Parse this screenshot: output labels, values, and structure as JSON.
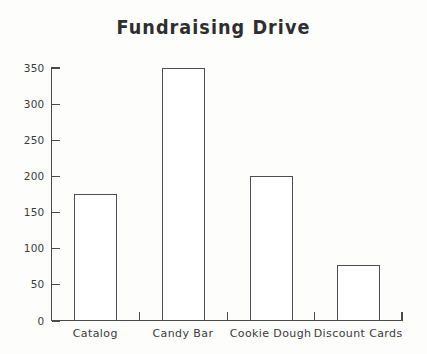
{
  "chart_data": {
    "type": "bar",
    "title": "Fundraising Drive",
    "xlabel": "",
    "ylabel": "",
    "categories": [
      "Catalog",
      "Candy Bar",
      "Cookie Dough",
      "Discount Cards"
    ],
    "values": [
      175,
      350,
      200,
      77
    ],
    "ylim": [
      0,
      350
    ],
    "yticks": [
      0,
      50,
      100,
      150,
      200,
      250,
      300,
      350
    ],
    "ytick_labels": [
      "0",
      "50",
      "100",
      "150",
      "200",
      "250",
      "300",
      "350"
    ],
    "grid": false,
    "legend": null,
    "bar_facecolor": "#ffffff",
    "bar_edgecolor": "#4d4d50",
    "axis_color": "#4a4a4c",
    "background": "#fdfdfc",
    "text_color": "#2e2e30"
  },
  "figure": {
    "title": "Fundraising Drive"
  }
}
